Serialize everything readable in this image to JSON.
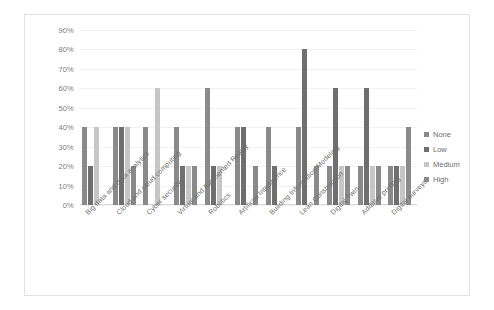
{
  "chart_data": {
    "type": "bar",
    "title": "",
    "subtitle": "",
    "xlabel": "",
    "ylabel": "",
    "ylim": [
      0,
      90
    ],
    "ytick_labels": [
      "0%",
      "10%",
      "20%",
      "30%",
      "40%",
      "50%",
      "60%",
      "70%",
      "80%",
      "90%"
    ],
    "ytick_values": [
      0,
      10,
      20,
      30,
      40,
      50,
      60,
      70,
      80,
      90
    ],
    "grid": true,
    "legend_position": "right",
    "categories": [
      "Big data and data analytics",
      "Cloud and cloud computing",
      "Cyber security",
      "Virtual and Augmented Reality",
      "Robotics",
      "Artificial Intelligence",
      "Building Information Modeling",
      "Lean Construction",
      "Digital Twin",
      "Additive printing",
      "Digital surveys"
    ],
    "series": [
      {
        "name": "None",
        "color": "#8a8a8a",
        "values": [
          40,
          40,
          40,
          40,
          60,
          40,
          40,
          40,
          20,
          20,
          20
        ]
      },
      {
        "name": "Low",
        "color": "#6f6f6f",
        "values": [
          20,
          40,
          0,
          20,
          20,
          40,
          20,
          80,
          60,
          60,
          20
        ]
      },
      {
        "name": "Medium",
        "color": "#c6c6c6",
        "values": [
          40,
          40,
          60,
          20,
          20,
          0,
          0,
          0,
          20,
          20,
          20
        ]
      },
      {
        "name": "High",
        "color": "#8a8a8a",
        "values": [
          0,
          20,
          0,
          20,
          0,
          20,
          0,
          20,
          20,
          20,
          40
        ]
      }
    ]
  },
  "legend": {
    "items": [
      {
        "label": "None",
        "key": "none"
      },
      {
        "label": "Low",
        "key": "low"
      },
      {
        "label": "Medium",
        "key": "medium"
      },
      {
        "label": "High",
        "key": "high"
      }
    ]
  },
  "colors": {
    "none": "#8a8a8a",
    "low": "#6f6f6f",
    "medium": "#c6c6c6",
    "high": "#8a8a8a",
    "gridline": "#f2f2f2",
    "axis": "#d9d9d9",
    "text": "#6e6e6e",
    "border": "#e2e2e2"
  }
}
